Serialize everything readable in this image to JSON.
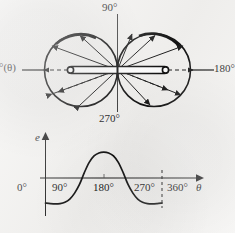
{
  "figure": {
    "title_present": false,
    "background_color": "#f3f2f0",
    "ink_color": "#1b1b1b"
  },
  "polar_plot": {
    "name": "antenna-radiation-pattern",
    "description": "Figure-eight two-lobe polar radiation pattern of a horizontal dipole antenna",
    "labels": {
      "top": "90°",
      "bottom": "270°",
      "right": "180°",
      "left": "°(θ)"
    },
    "center_element": "dipole-antenna-rod",
    "lobe_count": 2,
    "arrows": {
      "solid_outward": 8,
      "dashed": 4
    }
  },
  "waveform_plot": {
    "name": "emf-versus-theta-plot",
    "y_axis_label": "e",
    "x_axis_label": "θ",
    "x_ticks": [
      "0°",
      "90°",
      "180°",
      "270°",
      "360°"
    ],
    "chart_type": "line"
  },
  "chart_data": {
    "type": "line",
    "title": "",
    "xlabel": "θ",
    "ylabel": "e",
    "xlim": [
      0,
      360
    ],
    "ylim": [
      -1.15,
      1.15
    ],
    "grid": false,
    "legend": "none",
    "xticks": [
      0,
      90,
      180,
      270,
      360
    ],
    "xticklabels": [
      "0°",
      "90°",
      "180°",
      "270°",
      "360°"
    ],
    "yticks": [],
    "annotations": [
      "dashed vertical line at 360°"
    ],
    "series": [
      {
        "name": "e(θ)",
        "x": [
          0,
          15,
          30,
          45,
          60,
          75,
          90,
          105,
          120,
          135,
          150,
          165,
          180,
          195,
          210,
          225,
          240,
          255,
          270,
          285,
          300,
          315,
          330,
          345,
          360
        ],
        "y": [
          -0.93,
          -0.95,
          -0.96,
          -0.95,
          -0.9,
          -0.78,
          -0.56,
          -0.24,
          0.2,
          0.58,
          0.82,
          0.93,
          0.96,
          0.93,
          0.82,
          0.58,
          0.2,
          -0.24,
          -0.56,
          -0.78,
          -0.9,
          -0.95,
          -0.96,
          -0.95,
          -0.93
        ]
      }
    ]
  }
}
